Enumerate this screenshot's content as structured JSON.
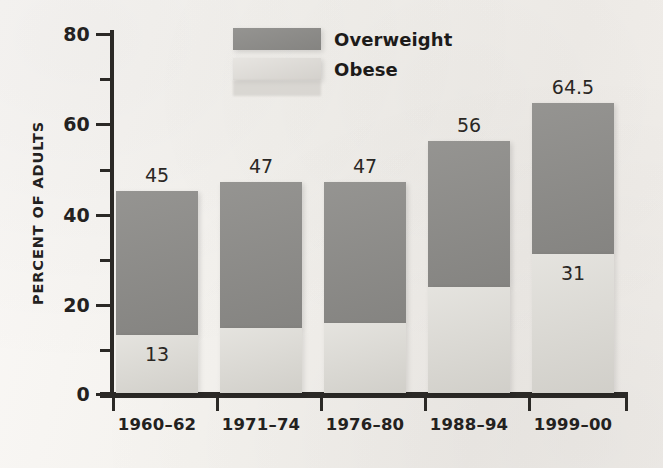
{
  "chart_data": {
    "type": "bar",
    "stacked": true,
    "title": "",
    "subtitle": "",
    "xlabel": "",
    "ylabel": "PERCENT OF ADULTS",
    "ylim": [
      0,
      80
    ],
    "ytick_labels": [
      "0",
      "20",
      "40",
      "60",
      "80"
    ],
    "ytick_values": [
      0,
      20,
      40,
      60,
      80
    ],
    "yminor_tick_values": [
      10,
      30,
      50,
      70
    ],
    "grid": false,
    "legend_position": "top-center",
    "categories": [
      "1960–62",
      "1971–74",
      "1976–80",
      "1988–94",
      "1999–00"
    ],
    "series": [
      {
        "name": "Overweight",
        "color": "#8d8c89",
        "values": [
          45,
          47,
          47,
          56,
          64.5
        ],
        "value_labels": [
          "45",
          "47",
          "47",
          "56",
          "64.5"
        ]
      },
      {
        "name": "Obese",
        "color": "#dcdad4",
        "values": [
          13,
          14.5,
          15.5,
          23.5,
          31
        ],
        "value_labels": [
          "13",
          "",
          "",
          "",
          "31"
        ]
      }
    ]
  },
  "legend": {
    "items": [
      {
        "label": "Overweight",
        "swatch": "overweight"
      },
      {
        "label": "Obese",
        "swatch": "obese"
      }
    ]
  },
  "axis": {
    "y_title": "PERCENT OF ADULTS",
    "ticks": [
      {
        "label": "80",
        "value": 80
      },
      {
        "label": "60",
        "value": 60
      },
      {
        "label": "40",
        "value": 40
      },
      {
        "label": "20",
        "value": 20
      },
      {
        "label": "0",
        "value": 0
      }
    ]
  },
  "bars": [
    {
      "category": "1960–62",
      "total_label": "45",
      "obese_label": "13"
    },
    {
      "category": "1971–74",
      "total_label": "47",
      "obese_label": ""
    },
    {
      "category": "1976–80",
      "total_label": "47",
      "obese_label": ""
    },
    {
      "category": "1988–94",
      "total_label": "56",
      "obese_label": ""
    },
    {
      "category": "1999–00",
      "total_label": "64.5",
      "obese_label": "31"
    }
  ],
  "colors": {
    "overweight": "#8d8c89",
    "obese": "#dcdad4",
    "axis": "#2b2926",
    "text": "#232120",
    "background": "#f6f4f1"
  }
}
